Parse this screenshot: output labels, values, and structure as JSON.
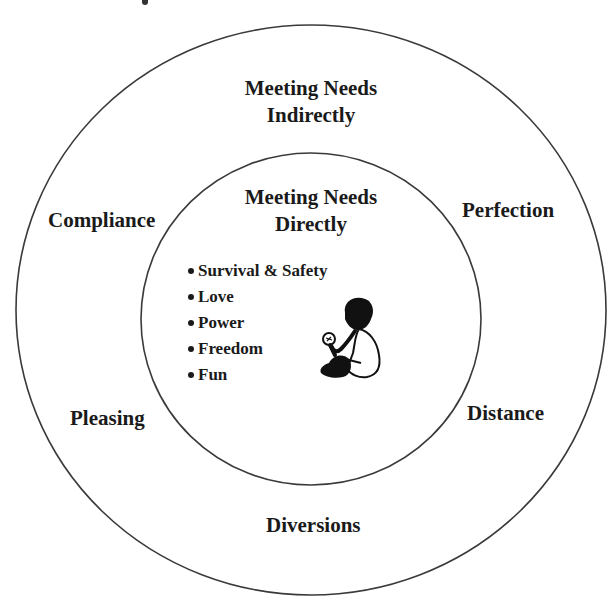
{
  "diagram": {
    "outer_ring": {
      "title_line1": "Meeting Needs",
      "title_line2": "Indirectly",
      "strategies": {
        "top_left": "Compliance",
        "top_right": "Perfection",
        "bottom_left": "Pleasing",
        "bottom_right": "Distance",
        "bottom": "Diversions"
      }
    },
    "inner_ring": {
      "title_line1": "Meeting Needs",
      "title_line2": "Directly",
      "needs": [
        "Survival & Safety",
        "Love",
        "Power",
        "Freedom",
        "Fun"
      ],
      "illustration": "child-sitting-icon"
    },
    "colors": {
      "line": "#3a3a3a",
      "text": "#1a1a1a",
      "background": "#ffffff"
    }
  }
}
